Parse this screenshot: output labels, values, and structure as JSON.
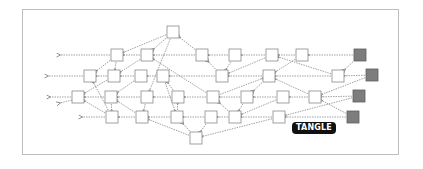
{
  "diagram": {
    "title_label": "TANGLE",
    "colors": {
      "confirmed_fill": "#ffffff",
      "confirmed_stroke": "#8a8a8a",
      "tip_fill": "#7d7d7d",
      "tip_stroke": "#5e5e5e",
      "edge": "#7a7a7a",
      "frame": "#bdbdbd",
      "label_bg": "#111111",
      "label_text": "#ffffff"
    },
    "node_size": 12,
    "nodes": [
      {
        "id": "t0",
        "x": 173,
        "y": 32,
        "tip": false
      },
      {
        "id": "a1",
        "x": 117,
        "y": 55,
        "tip": false
      },
      {
        "id": "a2",
        "x": 147,
        "y": 55,
        "tip": false
      },
      {
        "id": "a3",
        "x": 202,
        "y": 55,
        "tip": false
      },
      {
        "id": "a4",
        "x": 235,
        "y": 55,
        "tip": false
      },
      {
        "id": "a5",
        "x": 272,
        "y": 55,
        "tip": false
      },
      {
        "id": "a6",
        "x": 302,
        "y": 55,
        "tip": false
      },
      {
        "id": "a7",
        "x": 360,
        "y": 55,
        "tip": true
      },
      {
        "id": "b1",
        "x": 90,
        "y": 76,
        "tip": false
      },
      {
        "id": "b2",
        "x": 114,
        "y": 76,
        "tip": false
      },
      {
        "id": "b3",
        "x": 141,
        "y": 76,
        "tip": false
      },
      {
        "id": "b4",
        "x": 163,
        "y": 76,
        "tip": false
      },
      {
        "id": "b5",
        "x": 222,
        "y": 76,
        "tip": false
      },
      {
        "id": "b6",
        "x": 269,
        "y": 76,
        "tip": false
      },
      {
        "id": "b7",
        "x": 338,
        "y": 76,
        "tip": false
      },
      {
        "id": "b8",
        "x": 372,
        "y": 75,
        "tip": true
      },
      {
        "id": "c1",
        "x": 78,
        "y": 97,
        "tip": false
      },
      {
        "id": "c2",
        "x": 111,
        "y": 97,
        "tip": false
      },
      {
        "id": "c3",
        "x": 147,
        "y": 97,
        "tip": false
      },
      {
        "id": "c4",
        "x": 178,
        "y": 97,
        "tip": false
      },
      {
        "id": "c5",
        "x": 213,
        "y": 97,
        "tip": false
      },
      {
        "id": "c6",
        "x": 247,
        "y": 97,
        "tip": false
      },
      {
        "id": "c7",
        "x": 283,
        "y": 97,
        "tip": false
      },
      {
        "id": "c8",
        "x": 315,
        "y": 97,
        "tip": false
      },
      {
        "id": "c9",
        "x": 359,
        "y": 96,
        "tip": true
      },
      {
        "id": "d1",
        "x": 112,
        "y": 117,
        "tip": false
      },
      {
        "id": "d2",
        "x": 142,
        "y": 117,
        "tip": false
      },
      {
        "id": "d3",
        "x": 177,
        "y": 117,
        "tip": false
      },
      {
        "id": "d4",
        "x": 211,
        "y": 117,
        "tip": false
      },
      {
        "id": "d5",
        "x": 235,
        "y": 117,
        "tip": false
      },
      {
        "id": "d6",
        "x": 279,
        "y": 117,
        "tip": false
      },
      {
        "id": "d7",
        "x": 353,
        "y": 117,
        "tip": true
      },
      {
        "id": "e1",
        "x": 196,
        "y": 138,
        "tip": false
      }
    ],
    "edges": [
      [
        "a7",
        "a6"
      ],
      [
        "a7",
        "b7"
      ],
      [
        "b8",
        "b7"
      ],
      [
        "b8",
        "c8"
      ],
      [
        "c9",
        "c8"
      ],
      [
        "c9",
        "d6"
      ],
      [
        "d7",
        "d6"
      ],
      [
        "d7",
        "c8"
      ],
      [
        "a6",
        "a5"
      ],
      [
        "a6",
        "b6"
      ],
      [
        "b7",
        "b6"
      ],
      [
        "b7",
        "a5"
      ],
      [
        "c8",
        "c7"
      ],
      [
        "c8",
        "b6"
      ],
      [
        "d6",
        "d5"
      ],
      [
        "d6",
        "e1"
      ],
      [
        "a5",
        "a4"
      ],
      [
        "a5",
        "b5"
      ],
      [
        "b6",
        "b5"
      ],
      [
        "b6",
        "c6"
      ],
      [
        "c7",
        "c6"
      ],
      [
        "c7",
        "d5"
      ],
      [
        "d5",
        "d4"
      ],
      [
        "d5",
        "c5"
      ],
      [
        "a4",
        "a3"
      ],
      [
        "a4",
        "b5"
      ],
      [
        "b5",
        "a3"
      ],
      [
        "b5",
        "b4"
      ],
      [
        "c6",
        "c5"
      ],
      [
        "c6",
        "d5"
      ],
      [
        "a3",
        "a2"
      ],
      [
        "a3",
        "t0"
      ],
      [
        "c5",
        "c4"
      ],
      [
        "c5",
        "b6"
      ],
      [
        "c5",
        "a2"
      ],
      [
        "d4",
        "d3"
      ],
      [
        "d4",
        "e1"
      ],
      [
        "e1",
        "d3"
      ],
      [
        "e1",
        "d2"
      ],
      [
        "t0",
        "a2"
      ],
      [
        "t0",
        "a1"
      ],
      [
        "t0",
        "c3"
      ],
      [
        "a2",
        "a1"
      ],
      [
        "a2",
        "b2"
      ],
      [
        "b4",
        "b3"
      ],
      [
        "b4",
        "d3"
      ],
      [
        "c4",
        "c3"
      ],
      [
        "c4",
        "b4"
      ],
      [
        "d3",
        "d2"
      ],
      [
        "d3",
        "c4"
      ],
      [
        "b3",
        "b2"
      ],
      [
        "b3",
        "c2"
      ],
      [
        "c3",
        "c2"
      ],
      [
        "c3",
        "d2"
      ],
      [
        "d2",
        "d1"
      ],
      [
        "d2",
        "c2"
      ],
      [
        "a1",
        "b2"
      ],
      [
        "a1",
        "b1"
      ],
      [
        "b2",
        "b1"
      ],
      [
        "b2",
        "c1"
      ],
      [
        "c2",
        "c1"
      ],
      [
        "c2",
        "d1"
      ],
      [
        "d1",
        "c1"
      ],
      [
        "d1",
        "b1"
      ]
    ],
    "trailing_arrows": [
      {
        "from": "a1",
        "to_x": 60,
        "y": 55
      },
      {
        "from": "b1",
        "to_x": 48,
        "y": 76
      },
      {
        "from": "c1",
        "to_x": 50,
        "y": 97
      },
      {
        "from": "c1",
        "to_x": 60,
        "y": 104,
        "diag_y": 103
      },
      {
        "from": "d1",
        "to_x": 82,
        "y": 117
      }
    ]
  }
}
